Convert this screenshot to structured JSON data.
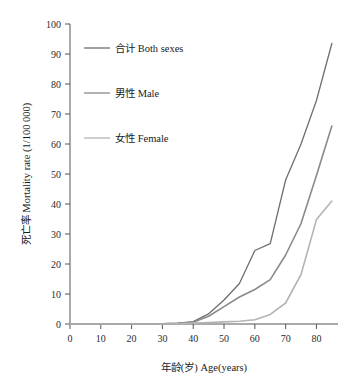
{
  "chart_data": {
    "type": "line",
    "title": "",
    "subtitle": "",
    "xlabel": "年龄(岁) Age(years)",
    "ylabel": "死亡率 Mortality rate (1/100 000)",
    "xlim": [
      0,
      87
    ],
    "ylim": [
      0,
      100
    ],
    "xticks": [
      0,
      10,
      20,
      30,
      40,
      50,
      60,
      70,
      80
    ],
    "xtick_labels": [
      "0",
      "10",
      "20",
      "30",
      "40",
      "50",
      "60",
      "70",
      "80"
    ],
    "yticks": [
      0,
      10,
      20,
      30,
      40,
      50,
      60,
      70,
      80,
      90,
      100
    ],
    "ytick_labels": [
      "0",
      "10",
      "20",
      "30",
      "40",
      "50",
      "60",
      "70",
      "80",
      "90",
      "100"
    ],
    "grid": false,
    "legend_position": "upper-left-inside",
    "x": [
      0,
      5,
      10,
      15,
      20,
      25,
      30,
      35,
      40,
      45,
      50,
      55,
      60,
      65,
      70,
      75,
      80,
      85
    ],
    "series": [
      {
        "name": "合计 Both sexes",
        "label_cn": "合计",
        "label_en": "Both sexes",
        "color": "#6e6e6e",
        "width": 1.3,
        "values": [
          0,
          0,
          0,
          0,
          0,
          0,
          0.1,
          0.3,
          0.8,
          3.4,
          8.0,
          13.5,
          24.5,
          26.8,
          48.0,
          60.0,
          74.5,
          93.5
        ]
      },
      {
        "name": "男性 Male",
        "label_cn": "男性",
        "label_en": "Male",
        "color": "#8a8a8a",
        "width": 1.6,
        "values": [
          0,
          0,
          0,
          0,
          0,
          0,
          0.1,
          0.2,
          0.6,
          2.6,
          5.8,
          9.0,
          11.5,
          14.8,
          23.0,
          33.5,
          49.5,
          66.0
        ]
      },
      {
        "name": "女性 Female",
        "label_cn": "女性",
        "label_en": "Female",
        "color": "#b4b4b4",
        "width": 1.6,
        "values": [
          0,
          0,
          0,
          0,
          0,
          0,
          0,
          0.1,
          0.3,
          0.5,
          0.7,
          0.9,
          1.4,
          3.2,
          7.0,
          16.5,
          34.8,
          41.0
        ]
      }
    ],
    "annotations": []
  },
  "legend": {
    "entries": [
      {
        "label": "合计 Both sexes"
      },
      {
        "label": "男性 Male"
      },
      {
        "label": "女性 Female"
      }
    ]
  },
  "axes": {
    "x_title": "年龄(岁) Age(years)",
    "y_title": "死亡率 Mortality rate (1/100 000)"
  }
}
